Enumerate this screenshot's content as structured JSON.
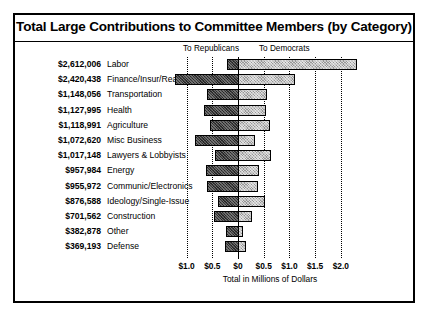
{
  "chart_data": {
    "type": "bar",
    "title": "Total Large Contributions to Committee Members (by Category)",
    "xlabel": "Total in Millions of Dollars",
    "ylabel": "",
    "xlim": [
      -1.25,
      2.3
    ],
    "grid": true,
    "legend_position": "top",
    "direction_labels": {
      "left": "To Republicans",
      "right": "To Democrats"
    },
    "tick_labels": [
      "$1.0",
      "$0.5",
      "$0",
      "$0.5",
      "$1.0",
      "$1.5",
      "$2.0"
    ],
    "tick_values": [
      -1.0,
      -0.5,
      0,
      0.5,
      1.0,
      1.5,
      2.0
    ],
    "series": [
      {
        "name": "To Republicans",
        "key": "republican"
      },
      {
        "name": "To Democrats",
        "key": "democrat"
      }
    ],
    "categories": [
      "Labor",
      "Finance/Insur/Real Est",
      "Transportation",
      "Health",
      "Agriculture",
      "Misc Business",
      "Lawyers & Lobbyists",
      "Energy",
      "Communic/Electronics",
      "Ideology/Single-Issue",
      "Construction",
      "Other",
      "Defense"
    ],
    "rows": [
      {
        "amount": "$2,612,006",
        "label": "Labor",
        "republican": -0.21,
        "democrat": 2.31
      },
      {
        "amount": "$2,420,438",
        "label": "Finance/Insur/Real Est",
        "republican": -1.22,
        "democrat": 1.11
      },
      {
        "amount": "$1,148,056",
        "label": "Transportation",
        "republican": -0.6,
        "democrat": 0.56
      },
      {
        "amount": "$1,127,995",
        "label": "Health",
        "republican": -0.66,
        "democrat": 0.54
      },
      {
        "amount": "$1,118,991",
        "label": "Agriculture",
        "republican": -0.54,
        "democrat": 0.63
      },
      {
        "amount": "$1,072,620",
        "label": "Misc Business",
        "republican": -0.83,
        "democrat": 0.34
      },
      {
        "amount": "$1,017,148",
        "label": "Lawyers & Lobbyists",
        "republican": -0.45,
        "democrat": 0.65
      },
      {
        "amount": "$957,984",
        "label": "Energy",
        "republican": -0.62,
        "democrat": 0.4
      },
      {
        "amount": "$955,972",
        "label": "Communic/Electronics",
        "republican": -0.6,
        "democrat": 0.38
      },
      {
        "amount": "$876,588",
        "label": "Ideology/Single-Issue",
        "republican": -0.38,
        "democrat": 0.52
      },
      {
        "amount": "$701,562",
        "label": "Construction",
        "republican": -0.47,
        "democrat": 0.27
      },
      {
        "amount": "$382,878",
        "label": "Other",
        "republican": -0.24,
        "democrat": 0.1
      },
      {
        "amount": "$369,193",
        "label": "Defense",
        "republican": -0.26,
        "democrat": 0.15
      }
    ]
  },
  "colors": {
    "republican_bar": "#3a3a3a",
    "democrat_bar": "#c2c2c2",
    "outline": "#000000",
    "background": "#ffffff"
  }
}
